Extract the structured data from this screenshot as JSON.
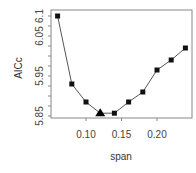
{
  "chart_data": {
    "type": "line",
    "title": "",
    "xlabel": "span",
    "ylabel": "AICc",
    "x": [
      0.06,
      0.08,
      0.1,
      0.12,
      0.14,
      0.16,
      0.18,
      0.2,
      0.22,
      0.24
    ],
    "series": [
      {
        "name": "AICc",
        "values": [
          6.1,
          5.93,
          5.885,
          5.857,
          5.857,
          5.885,
          5.91,
          5.965,
          5.99,
          6.02
        ],
        "marker": "square",
        "color": "#111111"
      }
    ],
    "highlight": {
      "x": 0.12,
      "y": 5.857,
      "marker": "triangle",
      "label": "minimum"
    },
    "xticks": [
      0.1,
      0.15,
      0.2
    ],
    "xtick_labels": [
      "0.10",
      "0.15",
      "0.20"
    ],
    "yticks": [
      5.85,
      5.95,
      6.05,
      6.1
    ],
    "ytick_labels": [
      "5.85",
      "5.95",
      "6.05",
      "6.1"
    ],
    "xlim": [
      0.052,
      0.25
    ],
    "ylim": [
      5.845,
      6.11
    ],
    "grid": false,
    "legend": null
  },
  "axes": {
    "x_title": "span",
    "y_title": "AICc"
  }
}
